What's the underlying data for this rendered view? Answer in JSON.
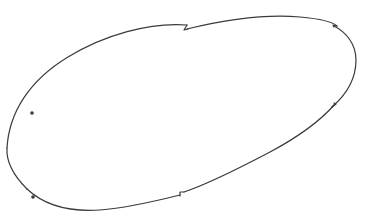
{
  "figure": {
    "title": "Hand-drawn tilted ellipse outline",
    "kind": "line-drawing",
    "canvas": {
      "width_px": 367,
      "height_px": 218,
      "background_color": "#ffffff"
    },
    "stroke": {
      "color": "#3a3a3f",
      "width_px": 1.2,
      "style": "solid"
    },
    "ellipse": {
      "center_x": 181,
      "center_y": 112,
      "semi_major_px": 181,
      "semi_minor_px": 66,
      "rotation_deg": -16.5,
      "extreme_left_px": 6,
      "extreme_right_px": 357,
      "extreme_top_px": 14,
      "extreme_bottom_px": 210
    },
    "seams": [
      {
        "name": "seam-top-left",
        "x": 187,
        "y": 29,
        "offset_px": 4,
        "kind": "zigzag"
      },
      {
        "name": "seam-top-right",
        "x": 336,
        "y": 26,
        "offset_px": 3,
        "kind": "notch"
      },
      {
        "name": "seam-right-mid",
        "x": 334,
        "y": 105,
        "offset_px": 3,
        "kind": "step"
      },
      {
        "name": "seam-bottom-mid",
        "x": 181,
        "y": 193,
        "offset_px": 3,
        "kind": "step"
      }
    ],
    "nodes": [
      {
        "name": "node-left-upper",
        "x": 32,
        "y": 113,
        "radius_px": 1.8
      },
      {
        "name": "node-left-lower",
        "x": 33,
        "y": 197,
        "radius_px": 1.8
      }
    ]
  }
}
